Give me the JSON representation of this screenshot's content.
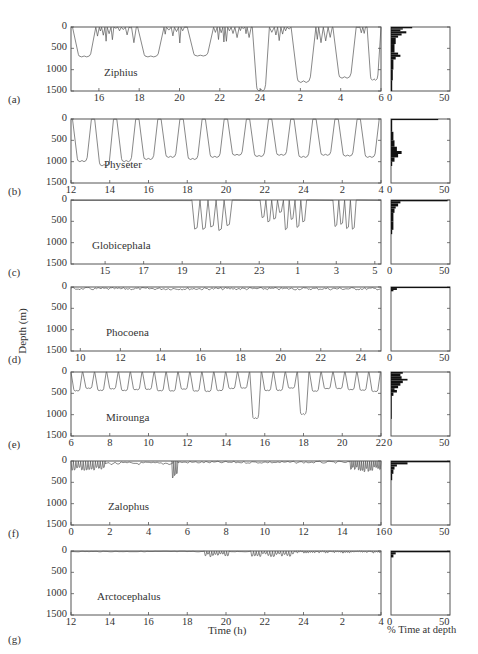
{
  "figure": {
    "y_axis_label": "Depth (m)",
    "x_axis_label": "Time (h)",
    "hist_axis_label": "% Time at depth",
    "depth_ticks": [
      "0",
      "500",
      "1000",
      "1500"
    ],
    "hist_ticks": [
      "0",
      "50"
    ]
  },
  "panels": [
    {
      "id": "a",
      "letter": "(a)",
      "species": "Ziphius",
      "x_ticks": [
        "16",
        "18",
        "20",
        "22",
        "24",
        "2",
        "4",
        "6"
      ]
    },
    {
      "id": "b",
      "letter": "(b)",
      "species": "Physeter",
      "x_ticks": [
        "12",
        "14",
        "16",
        "18",
        "20",
        "22",
        "24",
        "2",
        "4"
      ]
    },
    {
      "id": "c",
      "letter": "(c)",
      "species": "Globicephala",
      "x_ticks": [
        "15",
        "17",
        "19",
        "21",
        "23",
        "1",
        "3",
        "5"
      ]
    },
    {
      "id": "d",
      "letter": "(d)",
      "species": "Phocoena",
      "x_ticks": [
        "10",
        "12",
        "14",
        "16",
        "18",
        "20",
        "22",
        "24"
      ]
    },
    {
      "id": "e",
      "letter": "(e)",
      "species": "Mirounga",
      "x_ticks": [
        "6",
        "8",
        "10",
        "12",
        "14",
        "16",
        "18",
        "20",
        "22"
      ]
    },
    {
      "id": "f",
      "letter": "(f)",
      "species": "Zalophus",
      "x_ticks": [
        "0",
        "2",
        "4",
        "6",
        "8",
        "10",
        "12",
        "14",
        "16"
      ]
    },
    {
      "id": "g",
      "letter": "(g)",
      "species": "Arctocephalus",
      "x_ticks": [
        "12",
        "14",
        "16",
        "18",
        "20",
        "22",
        "24",
        "2",
        "4"
      ]
    }
  ],
  "chart_data": [
    {
      "type": "line",
      "title": "Ziphius",
      "panel": "(a)",
      "xlabel": "Time (h)",
      "ylabel": "Depth (m)",
      "ylim": [
        1500,
        0
      ],
      "x_ticks": [
        "16",
        "18",
        "20",
        "22",
        "24",
        "2",
        "4",
        "6"
      ],
      "description": "Deep foraging dives to ~700-1500 m separated by bouts of shallow dives (<400 m)",
      "dive_max_depths": [
        700,
        700,
        680,
        1500,
        1300,
        1200,
        1250,
        600
      ],
      "histogram": {
        "xlim": [
          0,
          50
        ],
        "peak_pct_near_surface": 14
      }
    },
    {
      "type": "line",
      "title": "Physeter",
      "panel": "(b)",
      "xlabel": "Time (h)",
      "ylabel": "Depth (m)",
      "ylim": [
        1500,
        0
      ],
      "x_ticks": [
        "12",
        "14",
        "16",
        "18",
        "20",
        "22",
        "24",
        "2",
        "4"
      ],
      "description": "Regular deep dives to ~800-1100 m",
      "dive_max_depths": [
        1000,
        1100,
        1000,
        950,
        900,
        900,
        850,
        800,
        900,
        950,
        1000,
        900,
        850,
        850,
        900
      ],
      "histogram": {
        "xlim": [
          0,
          50
        ],
        "peak_pct_near_surface": 40,
        "secondary_peak_depth": 800
      }
    },
    {
      "type": "line",
      "title": "Globicephala",
      "panel": "(c)",
      "xlabel": "Time (h)",
      "ylabel": "Depth (m)",
      "ylim": [
        1500,
        0
      ],
      "x_ticks": [
        "15",
        "17",
        "19",
        "21",
        "23",
        "1",
        "3",
        "5"
      ],
      "description": "Mostly at surface; bouts of dives to ~600-700 m",
      "dive_max_depths": [
        700,
        650,
        650,
        650,
        650,
        300,
        300,
        650,
        700,
        600,
        700,
        650,
        700
      ],
      "histogram": {
        "xlim": [
          0,
          50
        ],
        "peak_pct_near_surface": 48
      }
    },
    {
      "type": "line",
      "title": "Phocoena",
      "panel": "(d)",
      "xlabel": "Time (h)",
      "ylabel": "Depth (m)",
      "ylim": [
        1500,
        0
      ],
      "x_ticks": [
        "10",
        "12",
        "14",
        "16",
        "18",
        "20",
        "22",
        "24"
      ],
      "description": "Continuous shallow dives (<100 m)",
      "dive_max_depths": [
        50
      ],
      "histogram": {
        "xlim": [
          0,
          50
        ],
        "peak_pct_near_surface": 50
      }
    },
    {
      "type": "line",
      "title": "Mirounga",
      "panel": "(e)",
      "xlabel": "Time (h)",
      "ylabel": "Depth (m)",
      "ylim": [
        1500,
        0
      ],
      "x_ticks": [
        "6",
        "8",
        "10",
        "12",
        "14",
        "16",
        "18",
        "20",
        "22"
      ],
      "description": "Continuous diving to ~400-500 m with occasional deeper dives to ~1100 m",
      "dive_max_depths": [
        450,
        450,
        450,
        500,
        450,
        400,
        500,
        400,
        450,
        450,
        1100,
        450,
        450,
        1000,
        450,
        450,
        500,
        400,
        450,
        450
      ],
      "histogram": {
        "xlim": [
          0,
          50
        ],
        "peak_pct_near_surface": 12
      }
    },
    {
      "type": "line",
      "title": "Zalophus",
      "panel": "(f)",
      "xlabel": "Time (h)",
      "ylabel": "Depth (m)",
      "ylim": [
        1500,
        0
      ],
      "x_ticks": [
        "0",
        "2",
        "4",
        "6",
        "8",
        "10",
        "12",
        "14",
        "16"
      ],
      "description": "Shallow dives (<200 m), one bout to ~450 m near hour 5.5",
      "dive_max_depths": [
        200,
        450,
        300
      ],
      "histogram": {
        "xlim": [
          0,
          50
        ],
        "peak_pct_near_surface": 50
      }
    },
    {
      "type": "line",
      "title": "Arctocephalus",
      "panel": "(g)",
      "xlabel": "Time (h)",
      "ylabel": "Depth (m)",
      "ylim": [
        1500,
        0
      ],
      "x_ticks": [
        "12",
        "14",
        "16",
        "18",
        "20",
        "22",
        "24",
        "2",
        "4"
      ],
      "description": "Shallow dives (<150 m) mostly at night",
      "dive_max_depths": [
        150
      ],
      "histogram": {
        "xlim": [
          0,
          50
        ],
        "peak_pct_near_surface": 50
      }
    }
  ]
}
